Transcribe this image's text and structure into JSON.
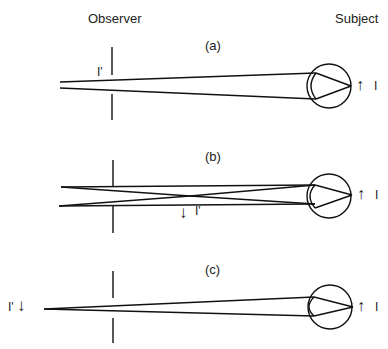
{
  "headers": {
    "observer": "Observer",
    "subject": "Subject"
  },
  "panels": [
    {
      "label": "(a)",
      "image_label": "I'",
      "object_label": "I"
    },
    {
      "label": "(b)",
      "image_label": "I'",
      "object_label": "I"
    },
    {
      "label": "(c)",
      "image_label": "I'",
      "object_label": "I"
    }
  ],
  "icons": {
    "up_arrow": "↑",
    "down_arrow": "↓"
  },
  "colors": {
    "stroke": "#111111",
    "background": "#ffffff"
  }
}
